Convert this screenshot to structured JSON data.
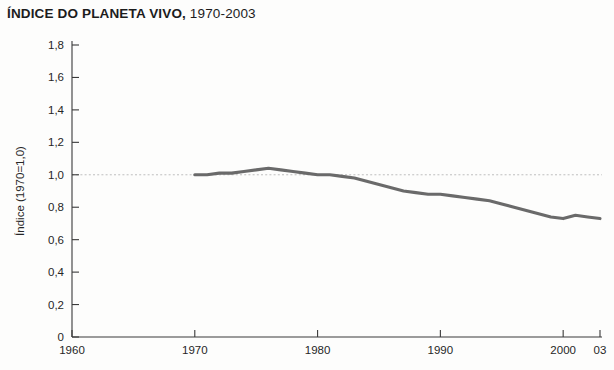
{
  "figure": {
    "title_main": "ÍNDICE DO PLANETA VIVO,",
    "title_sub": " 1970-2003",
    "background_color": "#fdfdfc",
    "line_color": "#6a6a6a",
    "axis_color": "#3a3a3a",
    "gridline_color": "#b9b9b9"
  },
  "chart_data": {
    "type": "line",
    "title": "ÍNDICE DO PLANETA VIVO, 1970-2003",
    "xlabel": "",
    "ylabel": "Índice (1970=1,0)",
    "xlim": [
      1960,
      2003
    ],
    "ylim": [
      0,
      1.8
    ],
    "grid": true,
    "gridlines_y": [
      1.0
    ],
    "legend": null,
    "x_tick_labels": [
      "1960",
      "1970",
      "1980",
      "1990",
      "2000",
      "03"
    ],
    "x_tick_values": [
      1960,
      1970,
      1980,
      1990,
      2000,
      2003
    ],
    "y_tick_labels": [
      "0",
      "0,2",
      "0,4",
      "0,6",
      "0,8",
      "1,0",
      "1,2",
      "1,4",
      "1,6",
      "1,8"
    ],
    "y_tick_values": [
      0,
      0.2,
      0.4,
      0.6,
      0.8,
      1.0,
      1.2,
      1.4,
      1.6,
      1.8
    ],
    "series": [
      {
        "name": "Índice do Planeta Vivo",
        "color": "#6a6a6a",
        "x": [
          1970,
          1971,
          1972,
          1973,
          1974,
          1975,
          1976,
          1977,
          1978,
          1979,
          1980,
          1981,
          1982,
          1983,
          1984,
          1985,
          1986,
          1987,
          1988,
          1989,
          1990,
          1991,
          1992,
          1993,
          1994,
          1995,
          1996,
          1997,
          1998,
          1999,
          2000,
          2001,
          2002,
          2003
        ],
        "values": [
          1.0,
          1.0,
          1.01,
          1.01,
          1.02,
          1.03,
          1.04,
          1.03,
          1.02,
          1.01,
          1.0,
          1.0,
          0.99,
          0.98,
          0.96,
          0.94,
          0.92,
          0.9,
          0.89,
          0.88,
          0.88,
          0.87,
          0.86,
          0.85,
          0.84,
          0.82,
          0.8,
          0.78,
          0.76,
          0.74,
          0.73,
          0.75,
          0.74,
          0.73
        ]
      }
    ]
  }
}
